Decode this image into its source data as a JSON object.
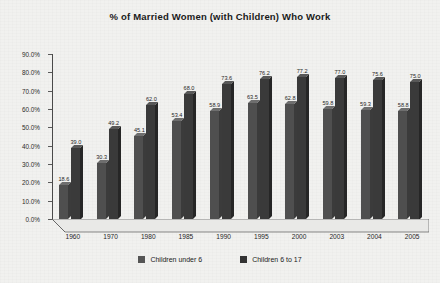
{
  "chart_data": {
    "type": "bar",
    "title": "% of Married Women (with Children) Who Work",
    "xlabel": "",
    "ylabel": "",
    "ylim": [
      0,
      90
    ],
    "ytick_labels": [
      "0.0%",
      "10.0%",
      "20.0%",
      "30.0%",
      "40.0%",
      "50.0%",
      "60.0%",
      "70.0%",
      "80.0%",
      "90.0%"
    ],
    "ytick_values": [
      0,
      10,
      20,
      30,
      40,
      50,
      60,
      70,
      80,
      90
    ],
    "grid": false,
    "legend_position": "bottom",
    "categories": [
      "1960",
      "1970",
      "1980",
      "1985",
      "1990",
      "1995",
      "2000",
      "2003",
      "2004",
      "2005"
    ],
    "series": [
      {
        "name": "Children under 6",
        "color": "#4f4f4f",
        "values": [
          18.6,
          30.3,
          45.1,
          53.4,
          58.9,
          63.5,
          62.8,
          59.8,
          59.3,
          58.8
        ],
        "labels": [
          "18.6",
          "30.3",
          "45.1",
          "53.4",
          "58.9",
          "63.5",
          "62.8",
          "59.8",
          "59.3",
          "58.8"
        ]
      },
      {
        "name": "Children 6 to 17",
        "color": "#3a3a3a",
        "values": [
          39.0,
          49.2,
          62.0,
          68.0,
          73.6,
          76.2,
          77.2,
          77.0,
          75.6,
          75.0
        ],
        "labels": [
          "39.0",
          "49.2",
          "62.0",
          "68.0",
          "73.6",
          "76.2",
          "77.2",
          "77.0",
          "75.6",
          "75.0"
        ]
      }
    ]
  },
  "legend": {
    "items": [
      {
        "label": "Children under 6"
      },
      {
        "label": "Children 6 to 17"
      }
    ]
  }
}
